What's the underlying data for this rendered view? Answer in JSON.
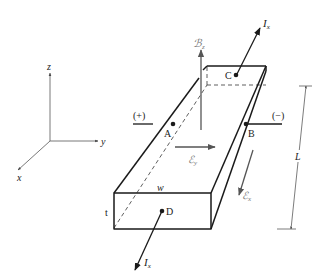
{
  "diagram": {
    "type": "hall-effect-bar",
    "colors": {
      "line": "#1a1a1a",
      "field": "#555555",
      "dim": "#444444",
      "background": "#ffffff"
    },
    "axes": {
      "z": "z",
      "y": "y",
      "x": "x"
    },
    "labels": {
      "current_top": "I",
      "current_top_sub": "x",
      "current_bottom": "I",
      "current_bottom_sub": "x",
      "magnetic_field": "ℬ",
      "magnetic_field_sub": "z",
      "electric_field_y": "ℰ",
      "electric_field_y_sub": "y",
      "electric_field_x": "ℰ",
      "electric_field_x_sub": "x",
      "point_a": "A",
      "point_b": "B",
      "point_c": "C",
      "point_d": "D",
      "plus_terminal": "(+)",
      "minus_terminal": "(−)",
      "width": "w",
      "thickness": "t",
      "length": "L"
    }
  }
}
